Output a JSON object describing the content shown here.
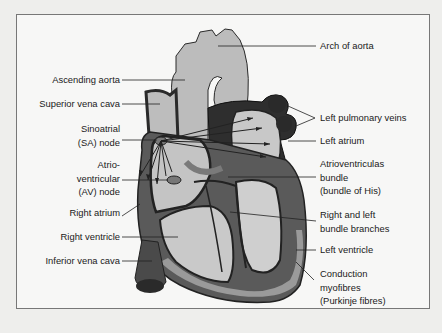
{
  "figure": {
    "colors": {
      "frame_border": "#777777",
      "background": "#f7f7f6",
      "tissue_light": "#bdbdbd",
      "tissue_mid": "#8e8e8e",
      "tissue_dark": "#3a3a3a",
      "outline": "#222222"
    },
    "labels_left": [
      {
        "id": "ascending-aorta",
        "lines": [
          "Ascending aorta"
        ]
      },
      {
        "id": "superior-vena-cava",
        "lines": [
          "Superior vena cava"
        ]
      },
      {
        "id": "sa-node",
        "lines": [
          "Sinoatrial",
          "(SA) node"
        ]
      },
      {
        "id": "av-node",
        "lines": [
          "Atrio-",
          "ventricular",
          "(AV) node"
        ]
      },
      {
        "id": "right-atrium",
        "lines": [
          "Right atrium"
        ]
      },
      {
        "id": "right-ventricle",
        "lines": [
          "Right ventricle"
        ]
      },
      {
        "id": "inferior-vena-cava",
        "lines": [
          "Inferior vena cava"
        ]
      }
    ],
    "labels_right": [
      {
        "id": "arch-of-aorta",
        "lines": [
          "Arch of aorta"
        ]
      },
      {
        "id": "left-pulmonary-veins",
        "lines": [
          "Left pulmonary veins"
        ]
      },
      {
        "id": "left-atrium",
        "lines": [
          "Left atrium"
        ]
      },
      {
        "id": "bundle-of-his",
        "lines": [
          "Atrioventriculas",
          "bundle",
          "(bundle of His)"
        ]
      },
      {
        "id": "bundle-branches",
        "lines": [
          "Right and left",
          "bundle branches"
        ]
      },
      {
        "id": "left-ventricle",
        "lines": [
          "Left ventricle"
        ]
      },
      {
        "id": "purkinje-fibres",
        "lines": [
          "Conduction",
          "myofibres",
          "(Purkinje fibres)"
        ]
      }
    ]
  }
}
